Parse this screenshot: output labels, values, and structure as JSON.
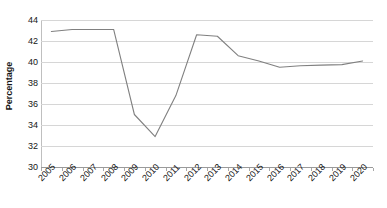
{
  "chart_data": {
    "type": "line",
    "title": "",
    "xlabel": "",
    "ylabel": "Percentage",
    "ylim": [
      30,
      44
    ],
    "ytick_step": 2,
    "yticks": [
      44,
      42,
      40,
      38,
      36,
      34,
      32,
      30
    ],
    "grid": true,
    "legend": "none",
    "line_color": "#808080",
    "gridline_color": "#d6d6d6",
    "axis_color": "#9a9a9a",
    "text_color": "#161616",
    "categories": [
      "2005",
      "2006",
      "2007",
      "2008",
      "2009",
      "2010",
      "2011",
      "2012",
      "2013",
      "2014",
      "2015",
      "2016",
      "2017",
      "2018",
      "2019",
      "2020"
    ],
    "values": [
      42.9,
      43.1,
      43.1,
      43.1,
      35.0,
      32.9,
      36.8,
      42.6,
      42.45,
      40.6,
      40.1,
      39.5,
      39.65,
      39.7,
      39.75,
      40.1
    ],
    "series": [
      {
        "name": "Percentage",
        "values": [
          42.9,
          43.1,
          43.1,
          43.1,
          35.0,
          32.9,
          36.8,
          42.6,
          42.45,
          40.6,
          40.1,
          39.5,
          39.65,
          39.7,
          39.75,
          40.1
        ]
      }
    ]
  }
}
